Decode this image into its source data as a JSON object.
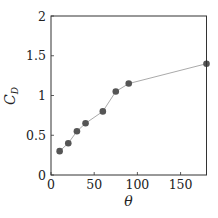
{
  "chart_data": {
    "type": "line",
    "title": "",
    "xlabel": "θ",
    "ylabel": "C_D",
    "ylabel_main": "C",
    "ylabel_sub": "D",
    "xlim": [
      0,
      180
    ],
    "ylim": [
      0,
      2
    ],
    "xticks": [
      0,
      50,
      100,
      150
    ],
    "xtick_labels": [
      "0",
      "50",
      "100",
      "150"
    ],
    "yticks": [
      0,
      0.5,
      1,
      1.5,
      2
    ],
    "ytick_labels": [
      "0",
      "0.5",
      "1",
      "1.5",
      "2"
    ],
    "grid": false,
    "legend": null,
    "series": [
      {
        "name": "C_D",
        "x": [
          10,
          20,
          30,
          40,
          60,
          75,
          90,
          180
        ],
        "y": [
          0.3,
          0.4,
          0.55,
          0.65,
          0.8,
          1.05,
          1.15,
          1.4
        ],
        "line_color": "#aaaaaa",
        "marker_color": "#555555"
      }
    ]
  }
}
